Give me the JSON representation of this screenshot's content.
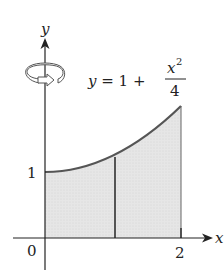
{
  "diagram": {
    "axes": {
      "x_label": "x",
      "y_label": "y",
      "origin_label": "0",
      "x_tick_label": "2",
      "y_tick_label": "1"
    },
    "equation": {
      "lhs": "y = 1 + ",
      "numerator": "x",
      "exponent": "2",
      "denominator": "4"
    },
    "rotation_icon": "rotation-arrow-icon",
    "colors": {
      "curve": "#555555",
      "fill": "#e4e4e4",
      "axis": "#222222",
      "text": "#222222"
    }
  }
}
